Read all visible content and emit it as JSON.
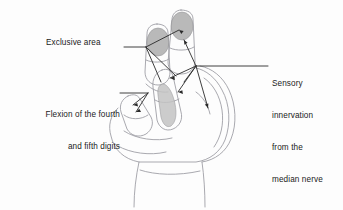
{
  "figure": {
    "background_color": "#fdfdfd",
    "line_color": "#2a2a2a",
    "outline_color": "#9a9aa0",
    "shade_color": "#b2b2b2",
    "text_color": "#1b1b1b"
  },
  "labels": {
    "exclusive_area": "Exclusive area",
    "flexion_line1": "Flexion of the fourth",
    "flexion_line2": "and fifth digits",
    "sensory_line1": "Sensory",
    "sensory_line2": "innervation",
    "sensory_line3": "from the",
    "sensory_line4": "median nerve"
  },
  "annotations": {
    "exclusive_area_targets": [
      "index-fingertip-patch",
      "middle-fingertip-patch"
    ],
    "flexion_targets": [
      "ring-finger",
      "little-finger"
    ],
    "sensory_targets": [
      "middle-finger-pad",
      "index-finger-pad",
      "palm-thenar",
      "thumb-web"
    ]
  },
  "shaded_regions": [
    {
      "name": "middle-fingertip-patch",
      "digit": "middle",
      "shade": "#b2b2b2"
    },
    {
      "name": "index-fingertip-patch",
      "digit": "index",
      "shade": "#b2b2b2"
    },
    {
      "name": "ring-finger-strip",
      "digit": "ring",
      "shade": "#c4c4c4"
    }
  ]
}
